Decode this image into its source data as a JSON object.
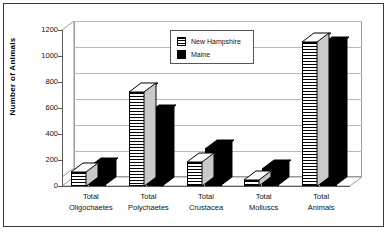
{
  "chart_data": {
    "type": "bar",
    "title": "",
    "xlabel": "",
    "ylabel": "Number of Animals",
    "ylim": [
      0,
      1200
    ],
    "yticks": [
      0,
      200,
      400,
      600,
      800,
      1000,
      1200
    ],
    "ytick_labels": [
      "0",
      "200",
      "400",
      "600",
      "800",
      "1000",
      "1200"
    ],
    "grid": true,
    "legend_position": "top-center",
    "style": "3d-clustered-column",
    "categories": [
      "Total Oligochaetes",
      "Total Polychaetes",
      "Total Crustacea",
      "Total Molluscs",
      "Total Animals"
    ],
    "category_lines": [
      [
        "Total",
        "Oligochaetes"
      ],
      [
        "Total",
        "Polychaetes"
      ],
      [
        "Total",
        "Crustacea"
      ],
      [
        "Total",
        "Molluscs"
      ],
      [
        "Total",
        "Animals"
      ]
    ],
    "series": [
      {
        "name": "New Hampshire",
        "pattern": "horizontal-stripes",
        "color": "#000000",
        "values": [
          110,
          725,
          185,
          45,
          1110
        ]
      },
      {
        "name": "Maine",
        "pattern": "solid",
        "color": "#000000",
        "values": [
          145,
          555,
          285,
          130,
          1075
        ]
      }
    ]
  },
  "legend": {
    "entries": [
      {
        "label": "New Hampshire",
        "swatch": "striped-swatch-icon"
      },
      {
        "label": "Maine",
        "swatch": "solid-swatch-icon"
      }
    ]
  }
}
